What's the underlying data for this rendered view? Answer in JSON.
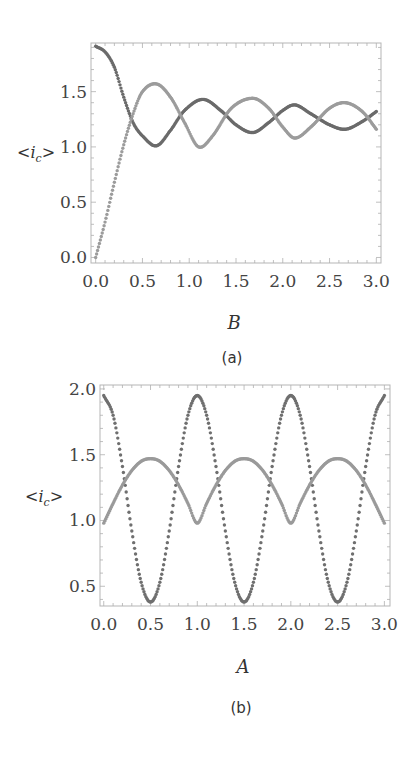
{
  "chart_data": [
    {
      "id": "a",
      "type": "scatter",
      "title": "",
      "caption": "(a)",
      "xlabel": "B",
      "ylabel": "<i_c>",
      "ylabel_main": "<i",
      "ylabel_sub": "c",
      "ylabel_end": ">",
      "xlim": [
        -0.05,
        3.05
      ],
      "ylim": [
        -0.05,
        1.94
      ],
      "xticks": [
        "0.0",
        "0.5",
        "1.0",
        "1.5",
        "2.0",
        "2.5",
        "3.0"
      ],
      "xtick_values": [
        0.0,
        0.5,
        1.0,
        1.5,
        2.0,
        2.5,
        3.0
      ],
      "yticks": [
        "0.0",
        "0.5",
        "1.0",
        "1.5"
      ],
      "ytick_values": [
        0.0,
        0.5,
        1.0,
        1.5
      ],
      "grid": false,
      "legend": "none",
      "series": [
        {
          "name": "dark series",
          "color": "#6b6b6b",
          "x": [
            0.0,
            0.1,
            0.2,
            0.3,
            0.4,
            0.5,
            0.65,
            0.8,
            0.95,
            1.15,
            1.35,
            1.5,
            1.68,
            1.85,
            2.0,
            2.13,
            2.3,
            2.5,
            2.67,
            2.85,
            3.0
          ],
          "values": [
            1.91,
            1.86,
            1.72,
            1.45,
            1.22,
            1.1,
            1.01,
            1.15,
            1.33,
            1.43,
            1.32,
            1.2,
            1.13,
            1.22,
            1.33,
            1.38,
            1.3,
            1.2,
            1.16,
            1.23,
            1.32
          ]
        },
        {
          "name": "light series",
          "color": "#9c9c9c",
          "x": [
            0.0,
            0.1,
            0.2,
            0.3,
            0.4,
            0.5,
            0.65,
            0.8,
            0.95,
            1.1,
            1.25,
            1.45,
            1.68,
            1.85,
            2.0,
            2.13,
            2.3,
            2.5,
            2.67,
            2.85,
            3.0
          ],
          "values": [
            0.0,
            0.32,
            0.68,
            1.02,
            1.3,
            1.5,
            1.57,
            1.45,
            1.22,
            1.0,
            1.1,
            1.35,
            1.44,
            1.35,
            1.18,
            1.08,
            1.18,
            1.35,
            1.4,
            1.32,
            1.16
          ]
        }
      ]
    },
    {
      "id": "b",
      "type": "scatter",
      "title": "",
      "caption": "(b)",
      "xlabel": "A",
      "ylabel": "<i_c>",
      "ylabel_main": "<i",
      "ylabel_sub": "c",
      "ylabel_end": ">",
      "xlim": [
        -0.04,
        3.06
      ],
      "ylim": [
        0.35,
        2.03
      ],
      "xticks": [
        "0.0",
        "0.5",
        "1.0",
        "1.5",
        "2.0",
        "2.5",
        "3.0"
      ],
      "xtick_values": [
        0.0,
        0.5,
        1.0,
        1.5,
        2.0,
        2.5,
        3.0
      ],
      "yticks": [
        "0.5",
        "1.0",
        "1.5",
        "2.0"
      ],
      "ytick_values": [
        0.5,
        1.0,
        1.5,
        2.0
      ],
      "grid": false,
      "legend": "none",
      "series": [
        {
          "name": "dotted series",
          "color": "#6f6f6f",
          "x": [
            0.0,
            0.1,
            0.2,
            0.3,
            0.4,
            0.5,
            0.6,
            0.7,
            0.8,
            0.9,
            1.0,
            1.1,
            1.2,
            1.3,
            1.4,
            1.5,
            1.6,
            1.7,
            1.8,
            1.9,
            2.0,
            2.1,
            2.2,
            2.3,
            2.4,
            2.5,
            2.6,
            2.7,
            2.8,
            2.9,
            3.0
          ],
          "values": [
            1.95,
            1.8,
            1.41,
            0.92,
            0.53,
            0.38,
            0.53,
            0.92,
            1.41,
            1.8,
            1.95,
            1.8,
            1.41,
            0.92,
            0.53,
            0.38,
            0.53,
            0.92,
            1.41,
            1.8,
            1.95,
            1.8,
            1.41,
            0.92,
            0.53,
            0.38,
            0.53,
            0.92,
            1.41,
            1.8,
            1.95
          ]
        },
        {
          "name": "solid series",
          "color": "#9a9a9a",
          "x": [
            0.0,
            0.1,
            0.2,
            0.3,
            0.4,
            0.5,
            0.6,
            0.7,
            0.8,
            0.9,
            1.0,
            1.1,
            1.2,
            1.3,
            1.4,
            1.5,
            1.6,
            1.7,
            1.8,
            1.9,
            2.0,
            2.1,
            2.2,
            2.3,
            2.4,
            2.5,
            2.6,
            2.7,
            2.8,
            2.9,
            3.0
          ],
          "values": [
            0.98,
            1.13,
            1.27,
            1.38,
            1.45,
            1.47,
            1.45,
            1.38,
            1.27,
            1.13,
            0.98,
            1.13,
            1.27,
            1.38,
            1.45,
            1.47,
            1.45,
            1.38,
            1.27,
            1.13,
            0.98,
            1.13,
            1.27,
            1.38,
            1.45,
            1.47,
            1.45,
            1.38,
            1.27,
            1.13,
            0.98
          ]
        }
      ]
    }
  ],
  "layout_frames": [
    {
      "left": 91,
      "top": 43,
      "right": 381,
      "bottom": 263,
      "xlabel_y": 329,
      "caption_y": 363,
      "ylabel_x": 17,
      "ylabel_y": 158
    },
    {
      "left": 100,
      "top": 385,
      "right": 390,
      "bottom": 606,
      "xlabel_y": 673,
      "caption_y": 713,
      "ylabel_x": 25,
      "ylabel_y": 502
    }
  ]
}
